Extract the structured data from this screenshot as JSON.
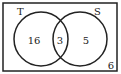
{
  "diagram": {
    "type": "venn",
    "sets": [
      {
        "label": "T",
        "only_count": "16"
      },
      {
        "label": "S",
        "only_count": "5"
      }
    ],
    "intersection_count": "3",
    "outside_count": "6"
  }
}
